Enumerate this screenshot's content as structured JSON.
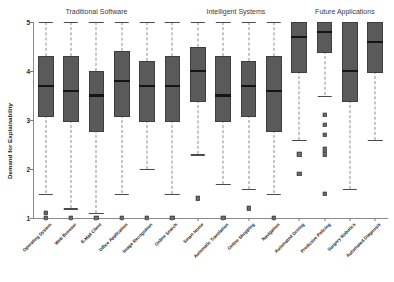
{
  "chart_data": {
    "type": "box",
    "title": "",
    "xlabel": "",
    "ylabel": "Demand for Explainability",
    "ylim": [
      1,
      5
    ],
    "yticks": [
      1,
      2,
      3,
      4,
      5
    ],
    "ytick_labels": [
      "1",
      "2",
      "3",
      "4",
      "5"
    ],
    "grid": false,
    "legend": "none",
    "group_headers": [
      {
        "label": "Traditional Software",
        "center_category_index": 2.0
      },
      {
        "label": "Intelligent Systems",
        "center_category_index": 7.5
      },
      {
        "label": "Future Applications",
        "center_category_index": 11.8
      }
    ],
    "categories": [
      "Operating System",
      "Web Browser",
      "E-Mail Client",
      "Office Application",
      "Image Recognition",
      "Online Search",
      "Smart Home",
      "Automatic Translation",
      "Online Shopping",
      "Navigation",
      "Automated Driving",
      "Predictive Policing",
      "Surgery Robotics",
      "Automated Diagnosis"
    ],
    "boxes": [
      {
        "category": "Operating System",
        "whisker_low": 1.5,
        "q1": 3.1,
        "median": 3.7,
        "q3": 4.3,
        "whisker_high": 5.0,
        "outliers": [
          1.1,
          1.0
        ]
      },
      {
        "category": "Web Browser",
        "whisker_low": 1.2,
        "q1": 3.0,
        "median": 3.6,
        "q3": 4.3,
        "whisker_high": 5.0,
        "outliers": [
          1.0
        ]
      },
      {
        "category": "E-Mail Client",
        "whisker_low": 1.1,
        "q1": 2.8,
        "median": 3.5,
        "q3": 4.0,
        "whisker_high": 5.0,
        "outliers": [
          1.0
        ]
      },
      {
        "category": "Office Application",
        "whisker_low": 1.5,
        "q1": 3.1,
        "median": 3.8,
        "q3": 4.4,
        "whisker_high": 5.0,
        "outliers": [
          1.0
        ]
      },
      {
        "category": "Image Recognition",
        "whisker_low": 2.0,
        "q1": 3.0,
        "median": 3.7,
        "q3": 4.2,
        "whisker_high": 5.0,
        "outliers": [
          1.0
        ]
      },
      {
        "category": "Online Search",
        "whisker_low": 1.5,
        "q1": 3.0,
        "median": 3.7,
        "q3": 4.3,
        "whisker_high": 5.0,
        "outliers": [
          1.0
        ]
      },
      {
        "category": "Smart Home",
        "whisker_low": 2.3,
        "q1": 3.4,
        "median": 4.0,
        "q3": 4.5,
        "whisker_high": 5.0,
        "outliers": [
          1.4
        ]
      },
      {
        "category": "Automatic Translation",
        "whisker_low": 1.7,
        "q1": 3.0,
        "median": 3.5,
        "q3": 4.3,
        "whisker_high": 5.0,
        "outliers": [
          1.0
        ]
      },
      {
        "category": "Online Shopping",
        "whisker_low": 1.6,
        "q1": 3.1,
        "median": 3.7,
        "q3": 4.2,
        "whisker_high": 5.0,
        "outliers": [
          1.2
        ]
      },
      {
        "category": "Navigation",
        "whisker_low": 1.5,
        "q1": 2.8,
        "median": 3.6,
        "q3": 4.3,
        "whisker_high": 5.0,
        "outliers": [
          1.0
        ]
      },
      {
        "category": "Automated Driving",
        "whisker_low": 2.6,
        "q1": 4.0,
        "median": 4.7,
        "q3": 5.0,
        "whisker_high": 5.0,
        "outliers": [
          2.3,
          1.9
        ]
      },
      {
        "category": "Predictive Policing",
        "whisker_low": 3.5,
        "q1": 4.4,
        "median": 4.8,
        "q3": 5.0,
        "whisker_high": 5.0,
        "outliers": [
          3.1,
          2.9,
          2.7,
          2.4,
          2.3,
          1.5
        ]
      },
      {
        "category": "Surgery Robotics",
        "whisker_low": 1.6,
        "q1": 3.4,
        "median": 4.0,
        "q3": 5.0,
        "whisker_high": 5.0,
        "outliers": []
      },
      {
        "category": "Automated Diagnosis",
        "whisker_low": 2.6,
        "q1": 4.0,
        "median": 4.6,
        "q3": 5.0,
        "whisker_high": 5.0,
        "outliers": []
      }
    ],
    "colors": {
      "box_fill": "#5a5a5a",
      "box_edge": "#3f3f3f",
      "median_line": "#141414",
      "whisker": "#8d8d8d",
      "axis": "#8a8a8a",
      "background": "#ffffff"
    }
  }
}
